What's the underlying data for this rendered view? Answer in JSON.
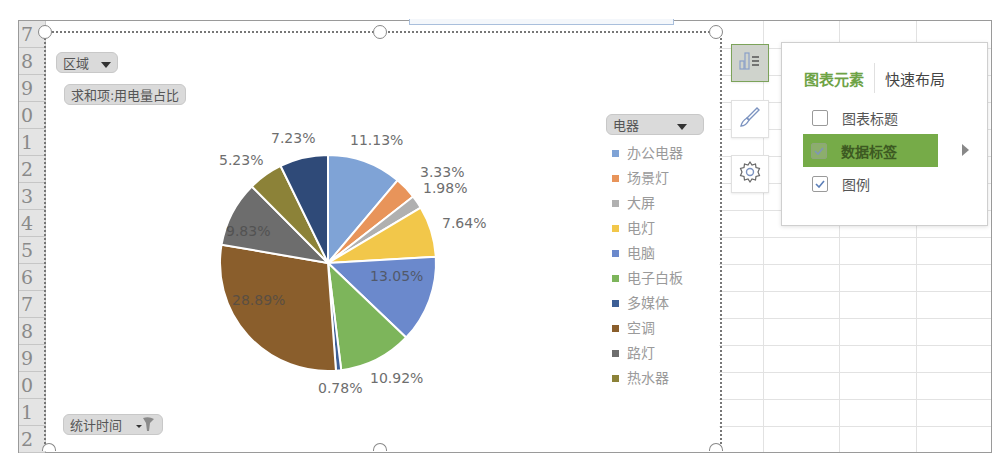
{
  "spreadsheet": {
    "row_headers": [
      "7",
      "8",
      "9",
      "0",
      "1",
      "2",
      "3",
      "4",
      "5",
      "6",
      "7",
      "8",
      "9",
      "0",
      "1",
      "2"
    ]
  },
  "pivot_chart": {
    "filter_field": {
      "label": "区域",
      "icon": "dropdown-caret-icon"
    },
    "value_field": {
      "label": "求和项:用电量占比"
    },
    "axis_field": {
      "label": "统计时间",
      "icon": "filter-funnel-icon"
    },
    "legend_field": {
      "label": "电器",
      "icon": "dropdown-caret-icon"
    }
  },
  "chart_data": {
    "type": "pie",
    "title": "",
    "series_name": "求和项:用电量占比",
    "categories": [
      "办公电器",
      "场景灯",
      "大屏",
      "电灯",
      "电脑",
      "电子白板",
      "多媒体",
      "空调",
      "路灯",
      "热水器",
      ""
    ],
    "values": [
      11.13,
      3.33,
      1.98,
      7.64,
      13.05,
      10.92,
      0.78,
      28.89,
      9.83,
      5.23,
      7.23
    ],
    "labels": [
      "11.13%",
      "3.33%",
      "1.98%",
      "7.64%",
      "13.05%",
      "10.92%",
      "0.78%",
      "28.89%",
      "9.83%",
      "5.23%",
      "7.23%"
    ],
    "colors": [
      "#7fa3d6",
      "#e8945a",
      "#b0b0b0",
      "#f2c74a",
      "#6b89cc",
      "#7db55b",
      "#3d5f96",
      "#8a5e2c",
      "#6d6d6d",
      "#8c8238",
      "#2f4a78"
    ],
    "legend": {
      "position": "right",
      "entries": [
        "办公电器",
        "场景灯",
        "大屏",
        "电灯",
        "电脑",
        "电子白板",
        "多媒体",
        "空调",
        "路灯",
        "热水器"
      ]
    },
    "start_angle_deg": 0,
    "direction": "clockwise"
  },
  "side_buttons": [
    {
      "name": "chart-elements-button",
      "icon": "chart-elements-icon",
      "active": true
    },
    {
      "name": "chart-styles-button",
      "icon": "brush-icon",
      "active": false
    },
    {
      "name": "chart-filters-button",
      "icon": "gear-icon",
      "active": false
    }
  ],
  "chart_elements_popup": {
    "tabs": [
      {
        "label": "图表元素",
        "active": true
      },
      {
        "label": "快速布局",
        "active": false
      }
    ],
    "items": [
      {
        "label": "图表标题",
        "checked": false,
        "highlighted": false
      },
      {
        "label": "数据标签",
        "checked": true,
        "highlighted": true,
        "has_submenu": true
      },
      {
        "label": "图例",
        "checked": true,
        "highlighted": false
      }
    ]
  }
}
